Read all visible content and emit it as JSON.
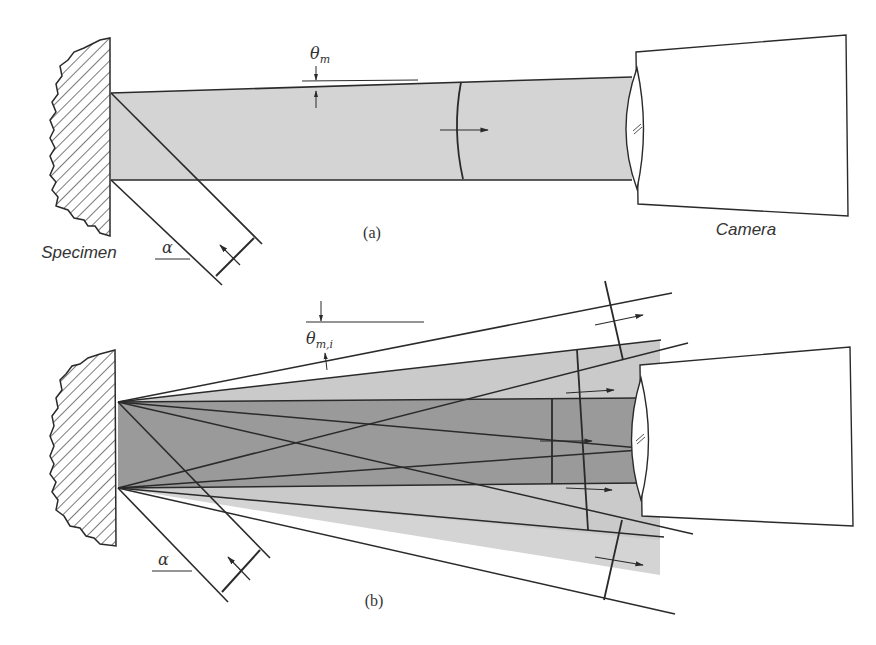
{
  "figure": {
    "panel_a": {
      "caption": "(a)",
      "specimen_label": "Specimen",
      "camera_label": "Camera",
      "angle_theta": "θ",
      "angle_theta_sub": "m",
      "angle_alpha": "α"
    },
    "panel_b": {
      "caption": "(b)",
      "angle_theta": "θ",
      "angle_theta_sub": "m,i",
      "angle_alpha": "α"
    },
    "colors": {
      "line": "#2a2a2a",
      "beam_light": "#d4d4d4",
      "beam_dark": "#9a9a9a",
      "background": "#ffffff"
    }
  }
}
